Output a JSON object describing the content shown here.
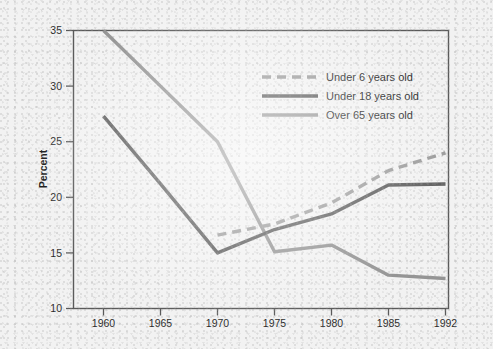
{
  "figure": {
    "background_color": "#f2f2f2",
    "plot_border_color": "#5a5a5a"
  },
  "chart_data": {
    "type": "line",
    "title": "",
    "subtitle": "",
    "xlabel": "",
    "ylabel": "Percent",
    "categories": [
      "1960",
      "1965",
      "1970",
      "1975",
      "1980",
      "1985",
      "1992"
    ],
    "xlim": [
      0,
      6
    ],
    "ylim": [
      10,
      35
    ],
    "yticks": [
      10,
      15,
      20,
      25,
      30,
      35
    ],
    "ytick_labels": [
      "10",
      "15",
      "20",
      "25",
      "30",
      "35"
    ],
    "xtick_labels": [
      "1960",
      "1965",
      "1970",
      "1975",
      "1980",
      "1985",
      "1992"
    ],
    "grid": false,
    "legend_position": "upper center",
    "series": [
      {
        "name": "Under 6 years old",
        "color": "#9a9a9a",
        "style": "dashed",
        "x": [
          "1970",
          "1975",
          "1980",
          "1985",
          "1992"
        ],
        "values": [
          16.6,
          17.6,
          19.5,
          22.4,
          24.0
        ]
      },
      {
        "name": "Under 18 years old",
        "color": "#595959",
        "style": "solid",
        "x": [
          "1960",
          "1965",
          "1970",
          "1975",
          "1980",
          "1985",
          "1992"
        ],
        "values": [
          27.3,
          21.2,
          15.0,
          17.1,
          18.5,
          21.1,
          21.2
        ]
      },
      {
        "name": "Over 65 years old",
        "color": "#949494",
        "style": "solid",
        "x": [
          "1960",
          "1965",
          "1970",
          "1975",
          "1980",
          "1985",
          "1992"
        ],
        "values": [
          35.0,
          30.0,
          25.0,
          15.1,
          15.7,
          13.0,
          12.7
        ]
      }
    ]
  },
  "legend": {
    "entries": [
      {
        "label": "Under 6 years old",
        "color": "#9a9a9a",
        "style": "dashed"
      },
      {
        "label": "Under 18 years old",
        "color": "#595959",
        "style": "solid"
      },
      {
        "label": "Over 65 years old",
        "color": "#949494",
        "style": "solid"
      }
    ]
  },
  "axis": {
    "y_title": "Percent",
    "y_tick_labels": [
      "35",
      "30",
      "25",
      "20",
      "15",
      "10"
    ],
    "x_tick_labels": [
      "1960",
      "1965",
      "1970",
      "1975",
      "1980",
      "1985",
      "1992"
    ]
  }
}
